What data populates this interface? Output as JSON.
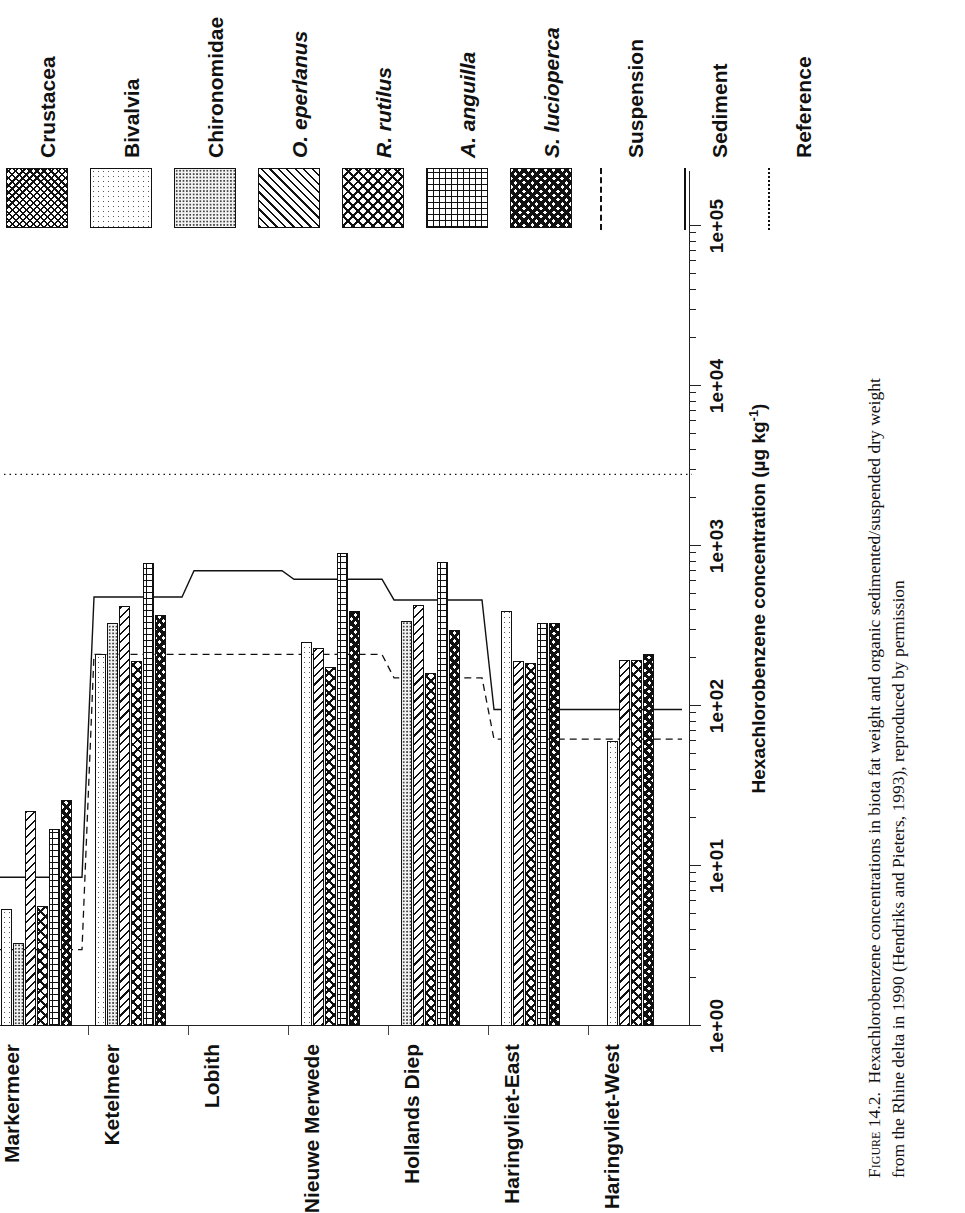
{
  "figure": {
    "number": "Figure 14.2.",
    "caption_line1": "Hexachlorobenzene concentrations in biota fat weight and organic sedimented/suspended dry weight",
    "caption_line2": "from the Rhine delta in 1990 (Hendriks and Pieters, 1993), reproduced by permission"
  },
  "legend": {
    "items": [
      {
        "label": "Crustacea",
        "pattern": "p-crustacea",
        "italic": false,
        "kind": "swatch"
      },
      {
        "label": "Bivalvia",
        "pattern": "p-bivalvia",
        "italic": false,
        "kind": "swatch"
      },
      {
        "label": "Chironomidae",
        "pattern": "p-chironomidae",
        "italic": false,
        "kind": "swatch"
      },
      {
        "label": "O. eperlanus",
        "pattern": "p-oeperlanus",
        "italic": true,
        "kind": "swatch"
      },
      {
        "label": "R. rutilus",
        "pattern": "p-rrutilus",
        "italic": true,
        "kind": "swatch"
      },
      {
        "label": "A. anguilla",
        "pattern": "p-aanguilla",
        "italic": true,
        "kind": "swatch"
      },
      {
        "label": "S. lucioperca",
        "pattern": "p-slucioperca",
        "italic": true,
        "kind": "swatch"
      },
      {
        "label": "Suspension",
        "pattern": "dashed",
        "italic": false,
        "kind": "line"
      },
      {
        "label": "Sediment",
        "pattern": "solid",
        "italic": false,
        "kind": "line"
      },
      {
        "label": "Reference",
        "pattern": "dotted",
        "italic": false,
        "kind": "line"
      }
    ]
  },
  "axis": {
    "category_header": "Location",
    "value_title": "Hexachlorobenzene concentration (µg kg",
    "value_title_sup": "-1",
    "value_title_tail": ")",
    "tick_labels": [
      "1e+00",
      "1e+01",
      "1e+02",
      "1e+03",
      "1e+04",
      "1e+05"
    ],
    "scale": "log10",
    "min": 1,
    "max": 100000
  },
  "chart_data": {
    "type": "bar",
    "orientation": "horizontal",
    "xlabel": "Hexachlorobenzene concentration (µg kg-1)",
    "ylabel": "Location",
    "xscale": "log",
    "xlim": [
      1,
      100000
    ],
    "grid": false,
    "legend_position": "top",
    "categories": [
      "Markermeer",
      "Ketelmeer",
      "Lobith",
      "Nieuwe Merwede",
      "Hollands Diep",
      "Haringvliet-East",
      "Haringvliet-West"
    ],
    "series": [
      {
        "name": "Crustacea",
        "values": [
          2.2,
          null,
          null,
          null,
          null,
          null,
          null
        ]
      },
      {
        "name": "Bivalvia",
        "values": [
          5.4,
          210,
          null,
          250,
          null,
          390,
          60
        ]
      },
      {
        "name": "Chironomidae",
        "values": [
          3.3,
          330,
          null,
          null,
          340,
          null,
          null
        ]
      },
      {
        "name": "O. eperlanus",
        "values": [
          22,
          420,
          null,
          230,
          430,
          190,
          195
        ]
      },
      {
        "name": "R. rutilus",
        "values": [
          5.6,
          190,
          null,
          175,
          160,
          185,
          195
        ]
      },
      {
        "name": "A. anguilla",
        "values": [
          17,
          780,
          null,
          900,
          800,
          330,
          null
        ]
      },
      {
        "name": "S. lucioperca",
        "values": [
          26,
          370,
          null,
          390,
          300,
          330,
          210
        ]
      }
    ],
    "reference_lines": [
      {
        "name": "Sediment",
        "style": "solid",
        "values": [
          8.5,
          480,
          700,
          620,
          460,
          95,
          95
        ]
      },
      {
        "name": "Suspension",
        "style": "dashed",
        "values": [
          3.0,
          210,
          210,
          210,
          150,
          62,
          62
        ]
      },
      {
        "name": "Reference",
        "style": "dotted",
        "value": 2800
      }
    ]
  }
}
